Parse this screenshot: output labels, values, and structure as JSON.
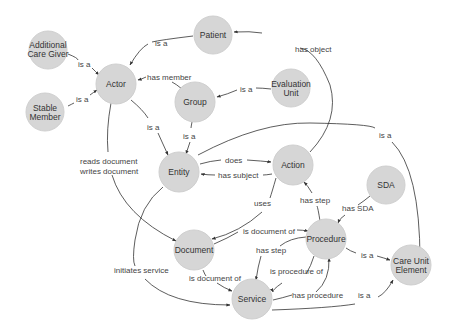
{
  "diagram": {
    "nodes": {
      "patient": "Patient",
      "additional_care_giver_1": "Additional",
      "additional_care_giver_2": "Care Giver",
      "actor": "Actor",
      "stable_member_1": "Stable",
      "stable_member_2": "Member",
      "group": "Group",
      "evaluation_unit_1": "Evaluation",
      "evaluation_unit_2": "Unit",
      "entity": "Entity",
      "action": "Action",
      "sda": "SDA",
      "document": "Document",
      "procedure": "Procedure",
      "care_unit_element_1": "Care Unit",
      "care_unit_element_2": "Element",
      "service": "Service"
    },
    "edges": {
      "patient_actor": "is a",
      "acg_actor": "is a",
      "stable_actor": "is a",
      "group_actor": "has member",
      "eval_group": "is a",
      "actor_entity": "is a",
      "group_entity": "is a",
      "action_patient": "has object",
      "entity_cue": "is a",
      "entity_action": "does",
      "action_entity": "has subject",
      "actor_document_1": "reads document",
      "actor_document_2": "writes document",
      "action_document": "uses",
      "procedure_action": "has step",
      "sda_procedure": "has SDA",
      "document_procedure": "is document of",
      "procedure_service_step": "has step",
      "service_procedure_of": "is procedure of",
      "procedure_cue": "is a",
      "document_service": "is document of",
      "entity_service": "initiates service",
      "service_procedure": "has procedure",
      "service_cue": "is a"
    }
  }
}
